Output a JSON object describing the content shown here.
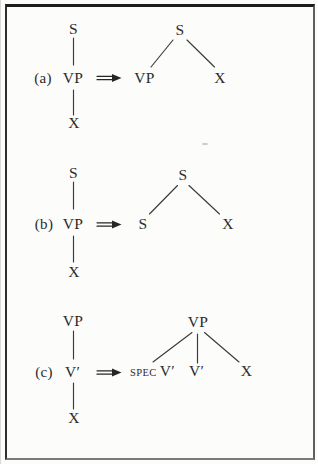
{
  "figure": {
    "colors": {
      "ink": "#2b2b2b",
      "paper": "#fcfcfa",
      "frame": "#1c1c1c"
    },
    "arrow_symbol": "double-shaft-right-arrow",
    "panels": [
      {
        "label": "(a)",
        "left_chain": [
          "S",
          "VP",
          "X"
        ],
        "right_root": "S",
        "right_children": [
          "VP",
          "X"
        ]
      },
      {
        "label": "(b)",
        "left_chain": [
          "S",
          "VP",
          "X"
        ],
        "right_root": "S",
        "right_children": [
          "S",
          "X"
        ]
      },
      {
        "label": "(c)",
        "left_chain": [
          "VP",
          "V′",
          "X"
        ],
        "right_root": "VP",
        "right_spec": "SPEC",
        "right_spec_head": "V′",
        "right_children": [
          "V′",
          "X"
        ]
      }
    ]
  }
}
